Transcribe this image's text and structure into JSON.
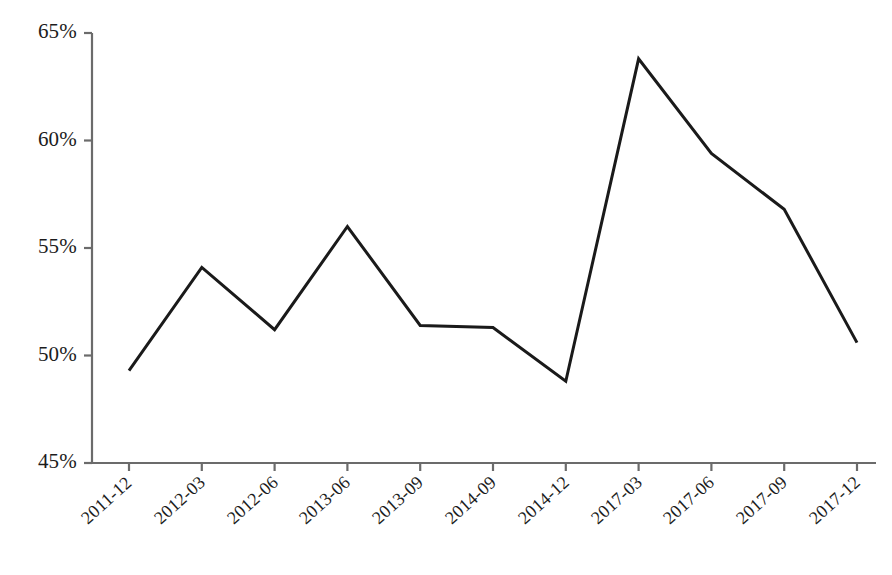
{
  "chart_data": {
    "type": "line",
    "title": "",
    "subtitle": "",
    "xlabel": "",
    "ylabel": "",
    "categories": [
      "2011-12",
      "2012-03",
      "2012-06",
      "2013-06",
      "2013-09",
      "2014-09",
      "2014-12",
      "2017-03",
      "2017-06",
      "2017-09",
      "2017-12"
    ],
    "values": [
      49.3,
      54.1,
      51.2,
      56.0,
      51.4,
      51.3,
      48.8,
      63.8,
      59.4,
      56.8,
      50.6
    ],
    "value_unit": "%",
    "ylim": [
      45,
      65
    ],
    "yticks": [
      45,
      50,
      55,
      60,
      65
    ],
    "ytick_labels": [
      "45%",
      "50%",
      "55%",
      "60%",
      "65%"
    ],
    "grid": false,
    "legend": null,
    "legend_position": "none",
    "series": [
      {
        "name": "",
        "values": [
          49.3,
          54.1,
          51.2,
          56.0,
          51.4,
          51.3,
          48.8,
          63.8,
          59.4,
          56.8,
          50.6
        ]
      }
    ],
    "annotations": []
  },
  "style": {
    "line_color": "#1a1a1a",
    "axis_color": "#6b6b6b",
    "text_color": "#1c1c1c",
    "background_color": "#ffffff",
    "line_width": 3
  },
  "geometry": {
    "plot_left": 92,
    "plot_right": 876,
    "plot_top": 33,
    "plot_bottom": 463,
    "first_point_x": 129,
    "point_spacing": 72.8,
    "y_at_45": 463,
    "y_at_65": 33,
    "tick_length": 8
  }
}
